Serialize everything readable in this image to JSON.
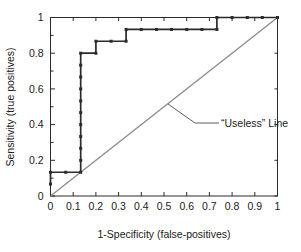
{
  "chart_data": {
    "type": "line",
    "title": "",
    "xlabel": "1-Specificity (false-positives)",
    "ylabel": "Sensitivity (true positives)",
    "xlim": [
      0,
      1
    ],
    "ylim": [
      0,
      1
    ],
    "grid": false,
    "legend_position": "none",
    "x_ticks": [
      "0",
      "0.1",
      "0.2",
      "0.3",
      "0.4",
      "0.5",
      "0.6",
      "0.7",
      "0.8",
      "0.9",
      "1"
    ],
    "x_tick_values": [
      0,
      0.1,
      0.2,
      0.3,
      0.4,
      0.5,
      0.6,
      0.7,
      0.8,
      0.9,
      1
    ],
    "y_ticks": [
      "0",
      "0.2",
      "0.4",
      "0.6",
      "0.8",
      "1"
    ],
    "y_tick_values": [
      0,
      0.2,
      0.4,
      0.6,
      0.8,
      1
    ],
    "y_minor_tick_values": [
      0.1,
      0.3,
      0.5,
      0.7,
      0.9
    ],
    "series": [
      {
        "name": "ROC curve",
        "type": "step-with-markers",
        "color": "#2b2b2b",
        "marker": "square",
        "points": [
          [
            0.0,
            0.067
          ],
          [
            0.0,
            0.133
          ],
          [
            0.067,
            0.133
          ],
          [
            0.133,
            0.133
          ],
          [
            0.133,
            0.2
          ],
          [
            0.133,
            0.267
          ],
          [
            0.133,
            0.333
          ],
          [
            0.133,
            0.4
          ],
          [
            0.133,
            0.467
          ],
          [
            0.133,
            0.533
          ],
          [
            0.133,
            0.6
          ],
          [
            0.133,
            0.667
          ],
          [
            0.133,
            0.733
          ],
          [
            0.133,
            0.8
          ],
          [
            0.2,
            0.8
          ],
          [
            0.2,
            0.867
          ],
          [
            0.267,
            0.867
          ],
          [
            0.333,
            0.867
          ],
          [
            0.333,
            0.933
          ],
          [
            0.4,
            0.933
          ],
          [
            0.467,
            0.933
          ],
          [
            0.533,
            0.933
          ],
          [
            0.6,
            0.933
          ],
          [
            0.667,
            0.933
          ],
          [
            0.733,
            0.933
          ],
          [
            0.733,
            1.0
          ],
          [
            0.8,
            1.0
          ],
          [
            0.867,
            1.0
          ],
          [
            0.933,
            1.0
          ],
          [
            1.0,
            1.0
          ]
        ]
      },
      {
        "name": "“Useless” Line",
        "type": "line",
        "color": "#8a8a8a",
        "points": [
          [
            0,
            0
          ],
          [
            1,
            1
          ]
        ]
      }
    ],
    "annotations": [
      {
        "text": "“Useless” Line",
        "x": 0.52,
        "y": 0.52,
        "leader": true
      }
    ]
  }
}
